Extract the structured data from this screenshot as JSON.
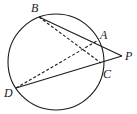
{
  "diagram": {
    "type": "geometry",
    "circle": {
      "cx": 56,
      "cy": 62,
      "r": 48
    },
    "points": {
      "A": {
        "label": "A",
        "x": 97,
        "y": 41,
        "lx": 100,
        "ly": 39
      },
      "B": {
        "label": "B",
        "x": 39,
        "y": 17,
        "lx": 31,
        "ly": 12
      },
      "C": {
        "label": "C",
        "x": 101,
        "y": 63,
        "lx": 103,
        "ly": 78
      },
      "D": {
        "label": "D",
        "x": 16,
        "y": 88,
        "lx": 4,
        "ly": 97
      },
      "P": {
        "label": "P",
        "x": 122,
        "y": 56,
        "lx": 125,
        "ly": 60
      }
    },
    "segments": [
      {
        "from": "B",
        "to": "P",
        "style": "solid"
      },
      {
        "from": "D",
        "to": "P",
        "style": "solid"
      },
      {
        "from": "B",
        "to": "C",
        "style": "dashed"
      },
      {
        "from": "D",
        "to": "A",
        "style": "dashed"
      }
    ]
  }
}
